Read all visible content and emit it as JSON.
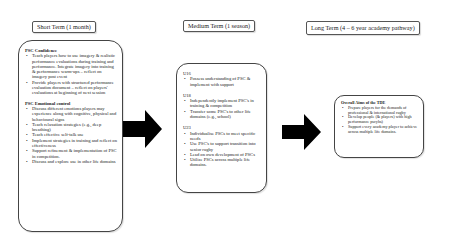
{
  "stages": [
    {
      "header": "Short Term (1 month)",
      "sections": [
        {
          "title": "PSC Confidence",
          "items": [
            "Teach players how to use imagery & realistic performance evaluations during training and performance. Integrate imagery into training & performance warm-ups – reflect on imagery post event",
            "Provide players with structured performance evaluation document – reflect on players' evaluations at beginning of next session"
          ]
        },
        {
          "title": "PSC Emotional control",
          "items": [
            "Discuss different emotions players may experience along with cognitive, physical and behavioural signs",
            "Teach relaxation strategies (e.g., deep breathing)",
            "Teach effective self-talk use",
            "Implement strategies in training and reflect on effectiveness",
            "Support refinement & implementation of PSC in competition.",
            "Discuss and explore use in other life domains"
          ]
        }
      ]
    },
    {
      "header": "Medium Term (1 season)",
      "sections": [
        {
          "title": "U16",
          "items": [
            "Possess understanding of PSC & implement with support"
          ]
        },
        {
          "title": "U18",
          "items": [
            "Independently implement PSC's in training & competition",
            "Transfer some PSC's to other life domains (e.g., school)"
          ]
        },
        {
          "title": "U23",
          "items": [
            "Individualise PSCs to meet specific needs",
            "Use PSC's to support transition into senior rugby",
            "Lead on own development of PSCs",
            "Utilize PSCs across multiple life domains."
          ]
        }
      ]
    },
    {
      "header": "Long Term (4 – 6 year academy pathway)",
      "sections": [
        {
          "title": "Overall Aims of the TDE",
          "items": [
            "Prepare players for the demands of professional & international rugby",
            "Develop people (& players) with high performance pscyhs)",
            "Support every academy player to achieve across multiple life domains."
          ]
        }
      ]
    }
  ],
  "arrows": [
    {
      "from": "Short Term",
      "to": "Medium Term",
      "color": "#000000"
    },
    {
      "from": "Medium Term",
      "to": "Long Term",
      "color": "#000000"
    }
  ]
}
